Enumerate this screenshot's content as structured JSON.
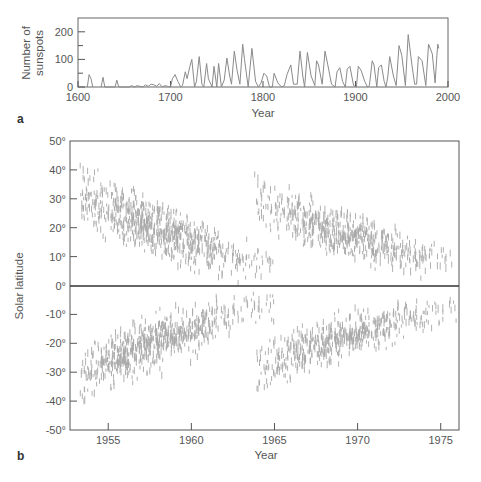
{
  "chart_data": [
    {
      "panel_label": "a",
      "type": "line",
      "title": "",
      "xlabel": "Year",
      "ylabel": "Number of sunspots",
      "ylabel_lines": [
        "Number of",
        "sunspots"
      ],
      "xlim": [
        1600,
        2000
      ],
      "ylim": [
        0,
        250
      ],
      "xticks": [
        1600,
        1700,
        1800,
        1900,
        2000
      ],
      "yticks": [
        0,
        100,
        200
      ],
      "yminor_ticks": [
        50,
        150
      ],
      "grid": false,
      "line_color": "#8a8a8a",
      "series": [
        {
          "name": "Sunspot number",
          "x": [
            1610,
            1612,
            1614,
            1616,
            1618,
            1620,
            1625,
            1627,
            1629,
            1640,
            1642,
            1644,
            1655,
            1658,
            1661,
            1664,
            1667,
            1670,
            1673,
            1676,
            1679,
            1682,
            1685,
            1688,
            1691,
            1694,
            1697,
            1700,
            1702,
            1705,
            1708,
            1711,
            1713,
            1716,
            1718,
            1721,
            1723,
            1726,
            1728,
            1731,
            1734,
            1736,
            1739,
            1741,
            1745,
            1747,
            1750,
            1752,
            1755,
            1758,
            1761,
            1764,
            1766,
            1769,
            1772,
            1775,
            1778,
            1780,
            1784,
            1788,
            1792,
            1795,
            1798,
            1801,
            1804,
            1807,
            1810,
            1812,
            1816,
            1820,
            1823,
            1826,
            1830,
            1833,
            1837,
            1840,
            1843,
            1845,
            1848,
            1852,
            1856,
            1858,
            1860,
            1864,
            1867,
            1870,
            1874,
            1878,
            1880,
            1883,
            1886,
            1889,
            1891,
            1894,
            1898,
            1901,
            1903,
            1906,
            1910,
            1913,
            1915,
            1918,
            1920,
            1923,
            1925,
            1928,
            1931,
            1933,
            1935,
            1937,
            1941,
            1944,
            1947,
            1950,
            1954,
            1957,
            1961,
            1964,
            1966,
            1968,
            1972,
            1976,
            1979,
            1983,
            1986,
            1988,
            1989,
            1990
          ],
          "y": [
            0,
            45,
            30,
            0,
            null,
            null,
            0,
            35,
            0,
            0,
            25,
            0,
            0,
            5,
            0,
            5,
            2,
            0,
            8,
            2,
            10,
            8,
            3,
            12,
            0,
            5,
            2,
            0,
            30,
            45,
            20,
            0,
            5,
            55,
            30,
            75,
            100,
            0,
            20,
            110,
            10,
            0,
            85,
            30,
            0,
            75,
            0,
            85,
            0,
            25,
            105,
            40,
            10,
            130,
            60,
            10,
            155,
            100,
            0,
            140,
            20,
            0,
            15,
            50,
            40,
            0,
            0,
            50,
            15,
            0,
            5,
            45,
            80,
            10,
            10,
            130,
            40,
            0,
            125,
            40,
            5,
            95,
            80,
            10,
            130,
            80,
            10,
            0,
            55,
            70,
            20,
            0,
            65,
            75,
            5,
            0,
            75,
            60,
            20,
            0,
            5,
            95,
            80,
            0,
            70,
            80,
            20,
            0,
            40,
            110,
            40,
            5,
            150,
            115,
            5,
            190,
            80,
            10,
            10,
            110,
            95,
            5,
            155,
            120,
            15,
            115,
            155,
            140
          ]
        }
      ]
    },
    {
      "panel_label": "b",
      "type": "scatter",
      "title": "",
      "xlabel": "Year",
      "ylabel": "Solar latitude",
      "xlim": [
        1952.7,
        1976.1
      ],
      "ylim": [
        -50,
        50
      ],
      "xticks": [
        1955,
        1960,
        1965,
        1970,
        1975
      ],
      "yticks": [
        50,
        40,
        30,
        20,
        10,
        0,
        -10,
        -20,
        -30,
        -40,
        -50
      ],
      "ytick_labels": [
        "50°",
        "40°",
        "30°",
        "20°",
        "10°",
        "0°",
        "-10°",
        "-20°",
        "-30°",
        "-40°",
        "-50°"
      ],
      "zero_line": true,
      "grid": false,
      "marker": "short vertical dash",
      "marker_color": "#a8a8a8",
      "description": "Butterfly diagram: sunspot latitudes vs time; each cycle starts at high latitude (~30-45°) and migrates toward the equator in both hemispheres",
      "cycles": [
        {
          "name": "Cycle 19",
          "start": 1953.3,
          "end": 1965.0,
          "peak": 1957.5,
          "lat_start": 32,
          "lat_end": 6,
          "spread": 9,
          "density": 1.0
        },
        {
          "name": "Cycle 20",
          "start": 1963.8,
          "end": 1976.1,
          "peak": 1968.8,
          "lat_start": 30,
          "lat_end": 7,
          "spread": 8,
          "density": 0.8
        }
      ]
    }
  ]
}
